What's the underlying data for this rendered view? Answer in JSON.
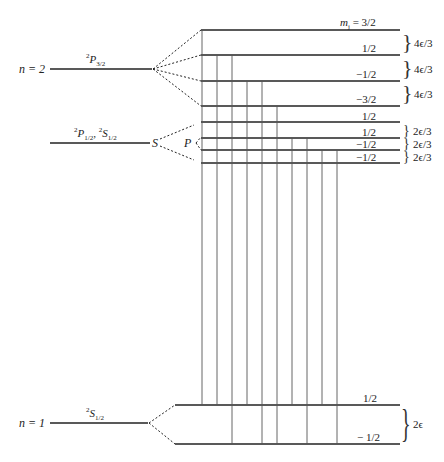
{
  "diagram": {
    "left_levels": [
      {
        "id": "n2",
        "label": "n = 2",
        "y": 69
      },
      {
        "id": "n1",
        "label": "n = 1",
        "y": 423
      }
    ],
    "terms": {
      "p32": {
        "sup": "2",
        "main": "P",
        "sub": "3/2"
      },
      "p12_s12": {
        "sup1": "2",
        "main1": "P",
        "sub1": "1/2",
        "sep": ", ",
        "sup2": "2",
        "main2": "S",
        "sub2": "1/2"
      },
      "s12": {
        "sup": "2",
        "main": "S",
        "sub": "1/2"
      }
    },
    "branch_labels": {
      "s": "S",
      "p": "P"
    },
    "mj_header": "m_j = 3/2",
    "mj_header_parts": {
      "m": "m",
      "j": "j",
      "eq": " = 3/2"
    },
    "sublevels_upper": [
      {
        "mj": "3/2",
        "y": 30
      },
      {
        "mj": "1/2",
        "y": 55
      },
      {
        "mj": "−1/2",
        "y": 81
      },
      {
        "mj": "−3/2",
        "y": 106
      }
    ],
    "sublevels_middle": [
      {
        "mj": "1/2",
        "y": 122
      },
      {
        "mj": "1/2",
        "y": 138
      },
      {
        "mj": "−1/2",
        "y": 150
      },
      {
        "mj": "−1/2",
        "y": 163
      }
    ],
    "sublevels_ground": [
      {
        "mj": "1/2",
        "y": 405
      },
      {
        "mj": "− 1/2",
        "y": 444
      }
    ],
    "spacings_upper": [
      "4ϵ/3",
      "4ϵ/3",
      "4ϵ/3"
    ],
    "spacings_middle": [
      "2ϵ/3",
      "2ϵ/3",
      "2ϵ/3"
    ],
    "spacing_ground": "2ϵ",
    "transitions_x": [
      202,
      217,
      232,
      247,
      262,
      277,
      292,
      307,
      322,
      337
    ]
  }
}
